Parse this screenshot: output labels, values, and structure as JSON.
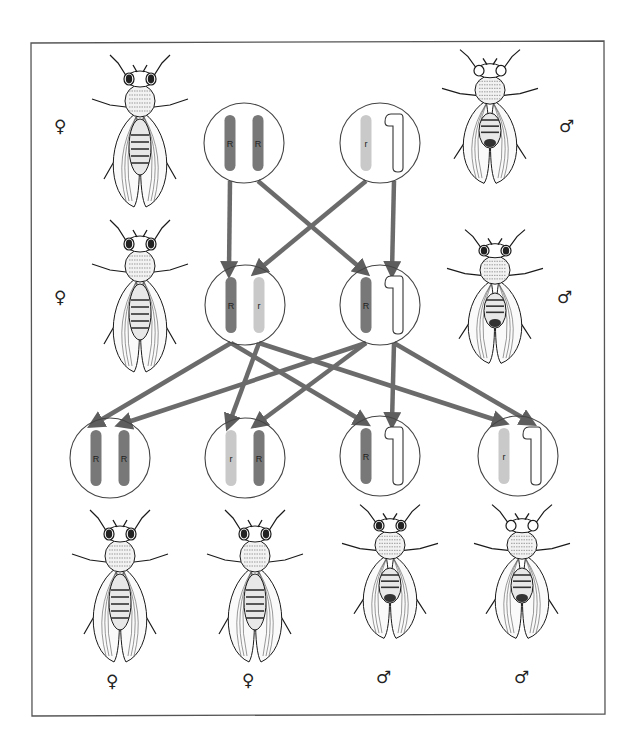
{
  "diagram": {
    "title": "",
    "colors": {
      "dominant_chromosome": "#787878",
      "recessive_chromosome": "#c9c9c9",
      "y_chromosome_outline": "#333333",
      "arrow": "#6b6b6b",
      "circle_outline": "#444444",
      "frame": "#555555"
    },
    "generations": [
      {
        "name": "P",
        "individuals": [
          {
            "id": "p-female",
            "sex_symbol": "♀",
            "genotype": [
              "R",
              "R"
            ],
            "eye": "red",
            "cx": 244,
            "cy": 143
          },
          {
            "id": "p-male",
            "sex_symbol": "♂",
            "genotype": [
              "r",
              "Y"
            ],
            "eye": "white",
            "cx": 380,
            "cy": 143
          }
        ]
      },
      {
        "name": "F1",
        "individuals": [
          {
            "id": "f1-female",
            "sex_symbol": "♀",
            "genotype": [
              "R",
              "r"
            ],
            "eye": "red",
            "cx": 245,
            "cy": 305
          },
          {
            "id": "f1-male",
            "sex_symbol": "♂",
            "genotype": [
              "R",
              "Y"
            ],
            "eye": "red",
            "cx": 380,
            "cy": 305
          }
        ]
      },
      {
        "name": "F2",
        "individuals": [
          {
            "id": "f2-1",
            "sex_symbol": "♀",
            "genotype": [
              "R",
              "R"
            ],
            "eye": "red",
            "cx": 110,
            "cy": 458
          },
          {
            "id": "f2-2",
            "sex_symbol": "♀",
            "genotype": [
              "r",
              "R"
            ],
            "eye": "red",
            "cx": 245,
            "cy": 458
          },
          {
            "id": "f2-3",
            "sex_symbol": "♂",
            "genotype": [
              "R",
              "Y"
            ],
            "eye": "red",
            "cx": 380,
            "cy": 456
          },
          {
            "id": "f2-4",
            "sex_symbol": "♂",
            "genotype": [
              "r",
              "Y"
            ],
            "eye": "white",
            "cx": 518,
            "cy": 456
          }
        ]
      }
    ],
    "labels": {
      "female": "♀",
      "male": "♂",
      "allele_dominant": "R",
      "allele_recessive": "r"
    },
    "arrows": [
      {
        "from": "p-female.R1",
        "to": "f1-female.R"
      },
      {
        "from": "p-female.R2",
        "to": "f1-male.R"
      },
      {
        "from": "p-male.r",
        "to": "f1-female.r"
      },
      {
        "from": "p-male.Y",
        "to": "f1-male.Y"
      },
      {
        "from": "f1-female.R",
        "to": "f2-1"
      },
      {
        "from": "f1-female.R",
        "to": "f2-3"
      },
      {
        "from": "f1-female.r",
        "to": "f2-2"
      },
      {
        "from": "f1-female.r",
        "to": "f2-4"
      },
      {
        "from": "f1-male.R",
        "to": "f2-1"
      },
      {
        "from": "f1-male.R",
        "to": "f2-2"
      },
      {
        "from": "f1-male.Y",
        "to": "f2-3"
      },
      {
        "from": "f1-male.Y",
        "to": "f2-4"
      }
    ],
    "flies": [
      {
        "id": "fly-p-female",
        "sex_symbol": "♀",
        "eye": "red",
        "x": 140,
        "y": 135
      },
      {
        "id": "fly-p-male",
        "sex_symbol": "♂",
        "eye": "white",
        "x": 490,
        "y": 120
      },
      {
        "id": "fly-f1-female",
        "sex_symbol": "♀",
        "eye": "red",
        "x": 140,
        "y": 300
      },
      {
        "id": "fly-f1-male",
        "sex_symbol": "♂",
        "eye": "red",
        "x": 495,
        "y": 300
      },
      {
        "id": "fly-f2-1",
        "sex_symbol": "♀",
        "eye": "red",
        "x": 120,
        "y": 590
      },
      {
        "id": "fly-f2-2",
        "sex_symbol": "♀",
        "eye": "red",
        "x": 255,
        "y": 590
      },
      {
        "id": "fly-f2-3",
        "sex_symbol": "♂",
        "eye": "red",
        "x": 390,
        "y": 575
      },
      {
        "id": "fly-f2-4",
        "sex_symbol": "♂",
        "eye": "white",
        "x": 522,
        "y": 575
      }
    ],
    "sex_symbols": [
      {
        "symbol": "♀",
        "x": 60,
        "y": 127
      },
      {
        "symbol": "♂",
        "x": 565,
        "y": 127
      },
      {
        "symbol": "♀",
        "x": 60,
        "y": 298
      },
      {
        "symbol": "♂",
        "x": 563,
        "y": 298
      },
      {
        "symbol": "♀",
        "x": 112,
        "y": 682
      },
      {
        "symbol": "♀",
        "x": 248,
        "y": 681
      },
      {
        "symbol": "♂",
        "x": 382,
        "y": 678
      },
      {
        "symbol": "♂",
        "x": 520,
        "y": 678
      }
    ]
  }
}
